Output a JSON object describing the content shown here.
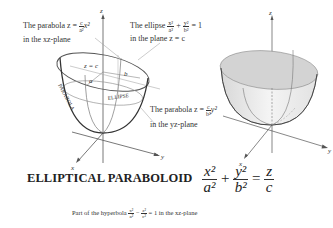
{
  "title": "ELLIPTICAL PARABOLOID",
  "equation": {
    "term1_num": "x²",
    "term1_den": "a²",
    "plus": "+",
    "term2_num": "y²",
    "term2_den": "b²",
    "equals": "=",
    "rhs_num": "z",
    "rhs_den": "c"
  },
  "annotations": {
    "parabola_xz": {
      "line1_prefix": "The parabola z =",
      "frac_num": "c",
      "frac_den": "a²",
      "suffix": "x²",
      "line2": "in the xz-plane"
    },
    "ellipse": {
      "line1_prefix": "The ellipse",
      "t1_num": "x²",
      "t1_den": "a²",
      "plus": "+",
      "t2_num": "y²",
      "t2_den": "b²",
      "rhs": "= 1",
      "line2": "in the plane z = c"
    },
    "parabola_yz": {
      "line1_prefix": "The parabola z =",
      "frac_num": "c",
      "frac_den": "b²",
      "suffix": "y²",
      "line2": "in the yz-plane"
    },
    "hyperbola": {
      "prefix": "Part of the hyperbola",
      "t1_num": "x²",
      "t1_den": "a²",
      "minus": "−",
      "t2_num": "z²",
      "t2_den": "c²",
      "suffix": "= 1 in the xz-plane"
    }
  },
  "diagram_labels": {
    "z_eq_c": "z = c",
    "a": "a",
    "b": "b",
    "parabola": "PARABOLA",
    "ellipse": "ELLIPSE",
    "axis_x": "x",
    "axis_y": "y",
    "axis_z": "z"
  },
  "colors": {
    "curve": "#444444",
    "axis": "#555555",
    "surface_fill": "#e4e4e4",
    "surface_top": "#d6d6d6",
    "guide": "#999999"
  }
}
